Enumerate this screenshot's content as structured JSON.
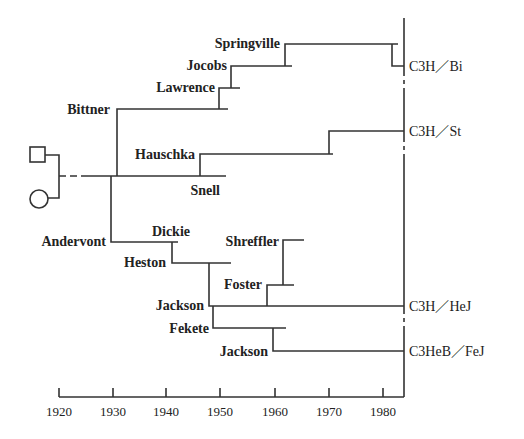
{
  "diagram": {
    "title": "",
    "axis": {
      "ticks": [
        "1920",
        "1930",
        "1940",
        "1950",
        "1960",
        "1970",
        "1980"
      ],
      "start_year": 1920,
      "end_year": 1984
    },
    "founders": {
      "male_symbol": "square",
      "female_symbol": "circle"
    },
    "investigators": [
      {
        "name": "Bittner",
        "year": 1930
      },
      {
        "name": "Lawrence",
        "year": 1951
      },
      {
        "name": "Jocobs",
        "year": 1952
      },
      {
        "name": "Springville",
        "year": 1962
      },
      {
        "name": "Hauschka",
        "year": 1946
      },
      {
        "name": "Snell",
        "year": 1951
      },
      {
        "name": "Andervont",
        "year": 1930
      },
      {
        "name": "Dickie",
        "year": 1941
      },
      {
        "name": "Heston",
        "year": 1941
      },
      {
        "name": "Shreffler",
        "year": 1961
      },
      {
        "name": "Foster",
        "year": 1958
      },
      {
        "name": "Jackson",
        "year": 1948
      },
      {
        "name": "Fekete",
        "year": 1948
      },
      {
        "name": "Jackson",
        "year": 1960
      }
    ],
    "strains": [
      {
        "name": "C3H／Bi"
      },
      {
        "name": "C3H／St"
      },
      {
        "name": "C3H／HeJ"
      },
      {
        "name": "C3HeB／FeJ"
      }
    ]
  }
}
